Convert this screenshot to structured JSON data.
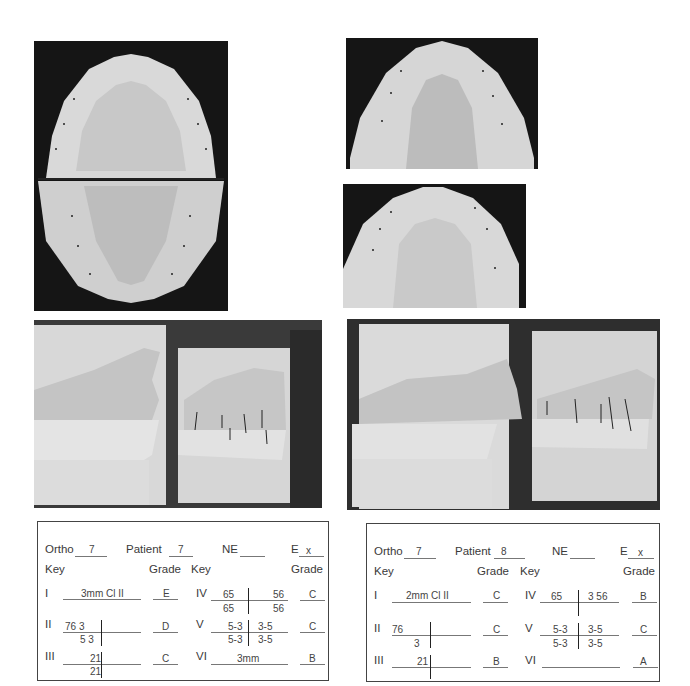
{
  "photos": [
    {
      "id": "occlusal-upper-lower-patient7",
      "alt": "Occlusal view of maxillary and mandibular casts (patient 7)"
    },
    {
      "id": "occlusal-lower-patient8",
      "alt": "Occlusal view of mandibular cast (patient 8)"
    },
    {
      "id": "occlusal-upper-patient8",
      "alt": "Occlusal view of maxillary cast (patient 8)"
    },
    {
      "id": "lateral-patient7",
      "alt": "Lateral views of occluded casts (patient 7)"
    },
    {
      "id": "lateral-patient8",
      "alt": "Lateral views of occluded casts (patient 8)"
    }
  ],
  "forms": [
    {
      "ortho_label": "Ortho",
      "ortho_value": "7",
      "patient_label": "Patient",
      "patient_value": "7",
      "ne_label": "NE",
      "ne_value": "",
      "e_label": "E",
      "e_value": "x",
      "key_label": "Key",
      "grade_label": "Grade",
      "rows_left": [
        {
          "numeral": "I",
          "text": "3mm  Cl II",
          "grade": "E"
        },
        {
          "numeral": "II",
          "upper_left": "76   3",
          "lower_left": "5 3",
          "upper_right": "",
          "lower_right": "",
          "grade": "D"
        },
        {
          "numeral": "III",
          "upper_left": "21",
          "lower_left": "21",
          "grade": "C"
        }
      ],
      "rows_right": [
        {
          "numeral": "IV",
          "upper_left": "65",
          "upper_right": "56",
          "lower_left": "65",
          "lower_right": "56",
          "grade": "C"
        },
        {
          "numeral": "V",
          "upper_left": "5-3",
          "upper_right": "3-5",
          "lower_left": "5-3",
          "lower_right": "3-5",
          "grade": "C"
        },
        {
          "numeral": "VI",
          "text": "3mm",
          "grade": "B"
        }
      ]
    },
    {
      "ortho_label": "Ortho",
      "ortho_value": "7",
      "patient_label": "Patient",
      "patient_value": "8",
      "ne_label": "NE",
      "ne_value": "",
      "e_label": "E",
      "e_value": "x",
      "key_label": "Key",
      "grade_label": "Grade",
      "rows_left": [
        {
          "numeral": "I",
          "text": "2mm  Cl II",
          "grade": "C"
        },
        {
          "numeral": "II",
          "upper_left": "76",
          "lower_left": "3",
          "grade": "C"
        },
        {
          "numeral": "III",
          "upper_left": "21",
          "lower_left": "",
          "grade": "B"
        }
      ],
      "rows_right": [
        {
          "numeral": "IV",
          "upper_left": "65",
          "upper_right": "3  56",
          "lower_left": "",
          "lower_right": "",
          "grade": "B"
        },
        {
          "numeral": "V",
          "upper_left": "5-3",
          "upper_right": "3-5",
          "lower_left": "5-3",
          "lower_right": "3-5",
          "grade": "C"
        },
        {
          "numeral": "VI",
          "text": "",
          "grade": "A"
        }
      ]
    }
  ]
}
